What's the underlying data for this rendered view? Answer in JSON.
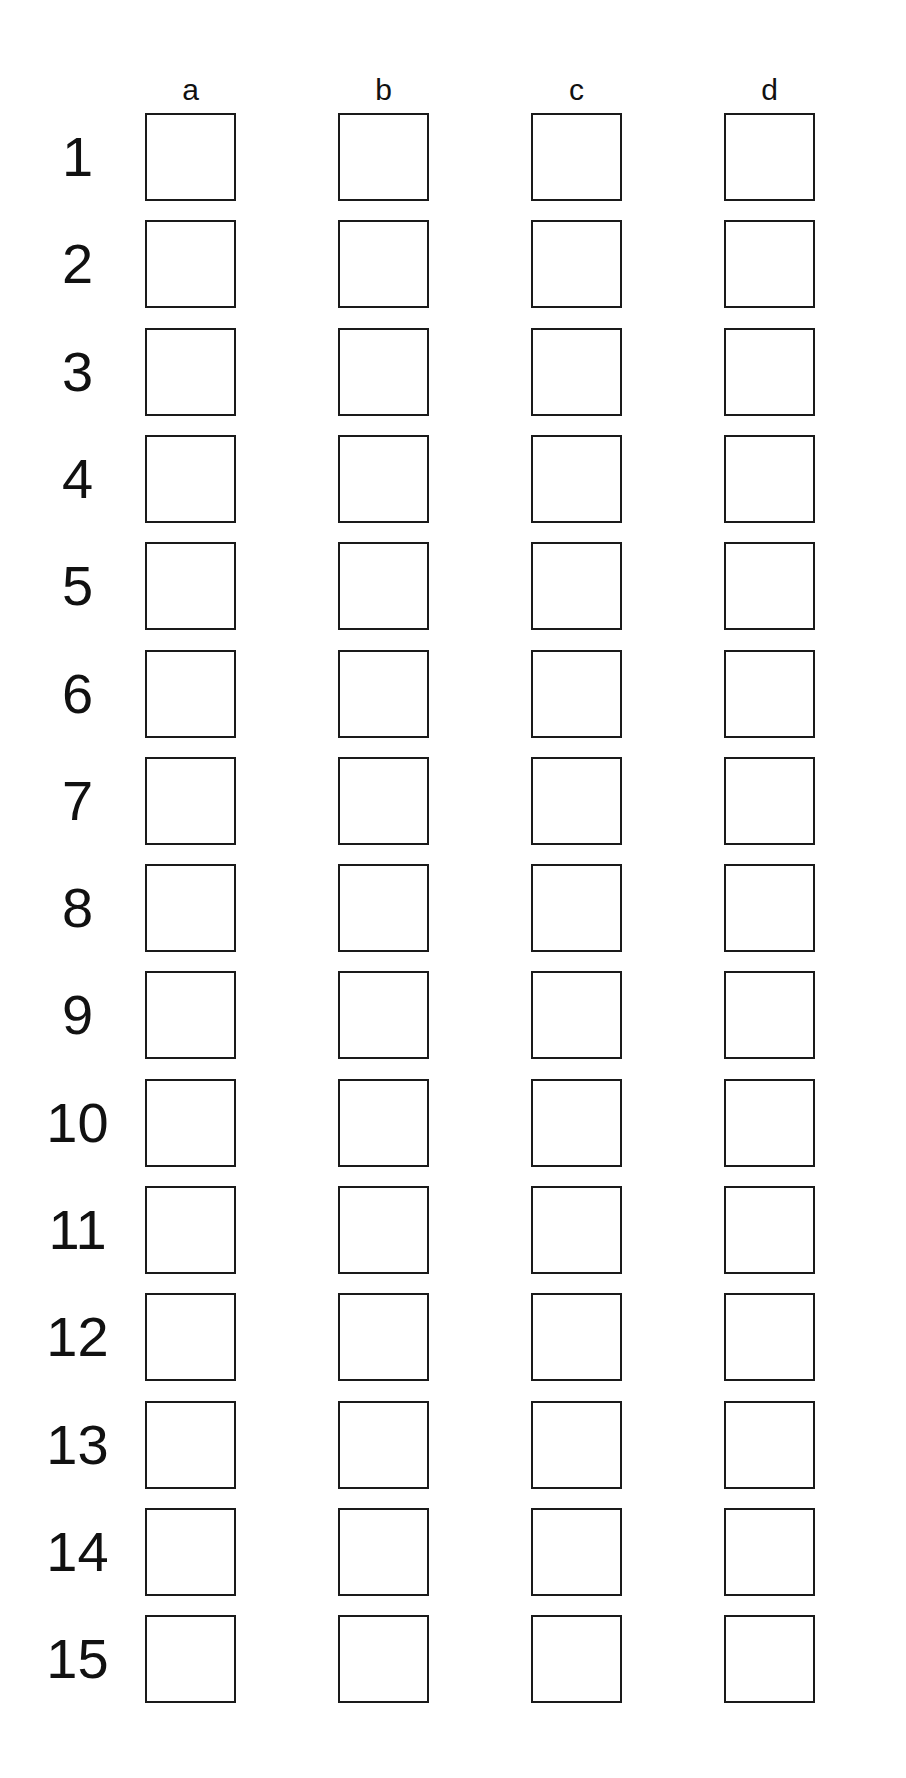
{
  "colors": {
    "dark_gray": "#6e6e6e",
    "mid_gray": "#9a9a9a",
    "light_gray": "#d2d2d2",
    "lighter_gray": "#e4e4e4",
    "outline": "#1a1a1a",
    "scribble": "#707070"
  },
  "columns": [
    {
      "label": "a"
    },
    {
      "label": "b"
    },
    {
      "label": "c"
    },
    {
      "label": "d"
    }
  ],
  "rows": [
    {
      "label": "1",
      "items": [
        {
          "icon": "triangle-pointing-left",
          "crossed_out": false
        },
        {
          "icon": "triangle-pointing-up",
          "crossed_out": true
        },
        {
          "icon": "triangle-pointing-right",
          "crossed_out": false
        },
        {
          "icon": "triangle-pointing-down",
          "crossed_out": false
        }
      ]
    },
    {
      "label": "2",
      "items": [
        {
          "icon": "gray-triangle",
          "crossed_out": false
        },
        {
          "icon": "square-with-black-square",
          "crossed_out": false
        },
        {
          "icon": "triangle-with-black-triangle",
          "crossed_out": false
        },
        {
          "icon": "circle-with-black-circle",
          "crossed_out": false
        }
      ]
    },
    {
      "label": "3",
      "items": [
        {
          "icon": "vertical-stripes-dark-light-mid",
          "crossed_out": false
        },
        {
          "icon": "horizontal-stripes-dark-mid-light",
          "crossed_out": false
        },
        {
          "icon": "vertical-stripes-mid-dark-light",
          "crossed_out": false
        },
        {
          "icon": "horizontal-stripes-light-mid-dark",
          "crossed_out": true
        }
      ]
    },
    {
      "label": "4",
      "items": [
        {
          "icon": "fish-facing-left",
          "crossed_out": false
        },
        {
          "icon": "fish-facing-right",
          "crossed_out": false
        },
        {
          "icon": "dark-fish-facing-left",
          "crossed_out": false
        },
        {
          "icon": "dark-fish-facing-right",
          "crossed_out": false
        }
      ]
    },
    {
      "label": "5",
      "items": [
        {
          "icon": "small-circle",
          "crossed_out": false
        },
        {
          "icon": "large-circle",
          "crossed_out": false
        },
        {
          "icon": "small-triangle",
          "crossed_out": false
        },
        {
          "icon": "large-triangle",
          "crossed_out": false
        }
      ]
    },
    {
      "label": "6",
      "items": [
        {
          "icon": "light-round-fruit",
          "crossed_out": false
        },
        {
          "icon": "apple",
          "crossed_out": false
        },
        {
          "icon": "pear",
          "crossed_out": false
        },
        {
          "icon": "dark-round-fruit",
          "crossed_out": true
        }
      ]
    },
    {
      "label": "7",
      "items": [
        {
          "icon": "u-shape-small-dot",
          "crossed_out": false
        },
        {
          "icon": "arch-large-dot",
          "crossed_out": false
        },
        {
          "icon": "u-shape-large-dot",
          "crossed_out": false
        },
        {
          "icon": "arch-small-dot",
          "crossed_out": false
        }
      ]
    },
    {
      "label": "8",
      "items": [
        {
          "icon": "letter-n",
          "crossed_out": false
        },
        {
          "icon": "mirrored-z",
          "crossed_out": false
        },
        {
          "icon": "letter-z",
          "crossed_out": false
        },
        {
          "icon": "mirrored-n",
          "crossed_out": false
        }
      ]
    },
    {
      "label": "9",
      "items": [
        {
          "icon": "plus-sign",
          "crossed_out": false
        },
        {
          "icon": "x-sign",
          "crossed_out": false
        },
        {
          "icon": "v-shape",
          "crossed_out": false
        },
        {
          "icon": "inverted-v-shape",
          "crossed_out": false
        }
      ]
    },
    {
      "label": "10",
      "items": [
        {
          "icon": "hexagon-dot-right",
          "crossed_out": false
        },
        {
          "icon": "hexagon-dot-top",
          "crossed_out": false
        },
        {
          "icon": "hexagon-dot-bottom",
          "crossed_out": false
        },
        {
          "icon": "hexagon-dot-left",
          "crossed_out": false
        }
      ]
    },
    {
      "label": "11",
      "items": [
        {
          "icon": "light-left-gray-right",
          "crossed_out": false
        },
        {
          "icon": "dark-left-light-right",
          "crossed_out": true
        },
        {
          "icon": "light-left-gray-right-2",
          "crossed_out": false
        },
        {
          "icon": "gray-left-light-right",
          "crossed_out": false
        }
      ]
    },
    {
      "label": "12",
      "items": [
        {
          "icon": "leaf-right-half-filled",
          "crossed_out": false
        },
        {
          "icon": "leaf-fully-filled",
          "crossed_out": false
        },
        {
          "icon": "leaf-left-half-filled",
          "crossed_out": false
        },
        {
          "icon": "leaf-empty",
          "crossed_out": false
        }
      ]
    },
    {
      "label": "13",
      "items": [
        {
          "icon": "glass-full",
          "crossed_out": false
        },
        {
          "icon": "glass-half",
          "crossed_out": false
        },
        {
          "icon": "glass-quarter",
          "crossed_out": false
        },
        {
          "icon": "glass-empty",
          "crossed_out": false
        }
      ]
    },
    {
      "label": "14",
      "items": [
        {
          "icon": "pencil-pointing-up",
          "crossed_out": false
        },
        {
          "icon": "pencil-pointing-right",
          "crossed_out": false
        },
        {
          "icon": "pencil-pointing-down",
          "crossed_out": false
        },
        {
          "icon": "pencil-pointing-left",
          "crossed_out": false
        }
      ]
    },
    {
      "label": "15",
      "items": [
        {
          "icon": "angle-bottom-left",
          "crossed_out": false
        },
        {
          "icon": "angle-top-right",
          "crossed_out": false
        },
        {
          "icon": "angle-vertical-left-stroke",
          "crossed_out": false
        },
        {
          "icon": "angle-vertical-right-stroke",
          "crossed_out": false
        }
      ]
    }
  ]
}
